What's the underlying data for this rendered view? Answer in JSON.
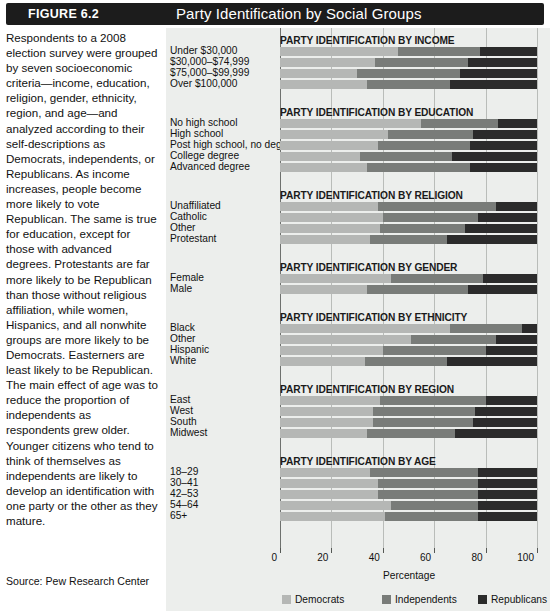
{
  "figure": {
    "number_label": "FIGURE 6.2",
    "title": "Party Identification by Social Groups"
  },
  "caption": {
    "body": "Respondents to a 2008 election survey were grouped by seven socioeconomic criteria—income, education, religion, gender, ethnicity, region, and age—and analyzed according to their self-descriptions as Democrats, independents, or Republicans. As income increases, people become more likely to vote Republican. The same is true for education, except for those with advanced degrees. Protestants are far more likely to be Republican than those without religious affiliation, while women, Hispanics, and all nonwhite groups are more likely to be Democrats. Easterners are least likely to be Republican. The main effect of age was to reduce the proportion of independents as respondents grew older. Younger citizens who tend to think of themselves as independents are likely to develop an identification with one party or the other as they mature.",
    "source": "Source: Pew Research Center"
  },
  "chart_data": {
    "type": "bar",
    "orientation": "horizontal",
    "stacked": true,
    "title": "Party Identification by Social Groups",
    "xlabel": "Percentage",
    "ylabel": "",
    "xlim": [
      0,
      100
    ],
    "xticks": [
      0,
      20,
      40,
      60,
      80,
      100
    ],
    "grid": "vertical",
    "legend_position": "bottom",
    "series": [
      {
        "name": "Democrats",
        "color": "#b5b7b5"
      },
      {
        "name": "Independents",
        "color": "#797c79"
      },
      {
        "name": "Republicans",
        "color": "#2b2b2b"
      }
    ],
    "panels": [
      {
        "title": "PARTY IDENTIFICATION BY INCOME",
        "categories": [
          "Under $30,000",
          "$30,000–$74,999",
          "$75,000–$99,999",
          "Over $100,000"
        ],
        "values": [
          [
            46,
            32,
            22
          ],
          [
            37,
            36,
            27
          ],
          [
            30,
            40,
            30
          ],
          [
            34,
            32,
            34
          ]
        ]
      },
      {
        "title": "PARTY IDENTIFICATION BY EDUCATION",
        "categories": [
          "No high school",
          "High school",
          "Post high school, no degree",
          "College degree",
          "Advanced degree"
        ],
        "values": [
          [
            55,
            30,
            15
          ],
          [
            42,
            33,
            25
          ],
          [
            38,
            36,
            26
          ],
          [
            31,
            36,
            33
          ],
          [
            34,
            40,
            26
          ]
        ]
      },
      {
        "title": "PARTY IDENTIFICATION BY RELIGION",
        "categories": [
          "Unaffiliated",
          "Catholic",
          "Other",
          "Protestant"
        ],
        "values": [
          [
            38,
            46,
            16
          ],
          [
            40,
            37,
            23
          ],
          [
            39,
            33,
            28
          ],
          [
            35,
            30,
            35
          ]
        ]
      },
      {
        "title": "PARTY IDENTIFICATION BY GENDER",
        "categories": [
          "Female",
          "Male"
        ],
        "values": [
          [
            43,
            36,
            21
          ],
          [
            34,
            39,
            27
          ]
        ]
      },
      {
        "title": "PARTY IDENTIFICATION BY ETHNICITY",
        "categories": [
          "Black",
          "Other",
          "Hispanic",
          "White"
        ],
        "values": [
          [
            66,
            28,
            6
          ],
          [
            51,
            33,
            16
          ],
          [
            40,
            40,
            20
          ],
          [
            33,
            32,
            35
          ]
        ]
      },
      {
        "title": "PARTY IDENTIFICATION BY REGION",
        "categories": [
          "East",
          "West",
          "South",
          "Midwest"
        ],
        "values": [
          [
            39,
            41,
            20
          ],
          [
            36,
            40,
            24
          ],
          [
            36,
            39,
            25
          ],
          [
            34,
            34,
            32
          ]
        ]
      },
      {
        "title": "PARTY IDENTIFICATION BY AGE",
        "categories": [
          "18–29",
          "30–41",
          "42–53",
          "54–64",
          "65+"
        ],
        "values": [
          [
            35,
            42,
            23
          ],
          [
            38,
            39,
            23
          ],
          [
            38,
            39,
            23
          ],
          [
            43,
            34,
            23
          ],
          [
            41,
            36,
            23
          ]
        ]
      }
    ]
  }
}
